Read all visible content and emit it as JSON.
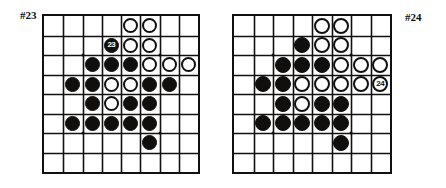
{
  "figure": {
    "kind": "go-problem-diagram",
    "board_size": 8,
    "colors": {
      "line": "#111111",
      "black_stone": "#100f0d",
      "white_stone": "#ffffff",
      "background": "#ffffff"
    }
  },
  "problems": [
    {
      "id": "problem-23",
      "label": "#23",
      "label_position": "top-left",
      "columns": 8,
      "rows": 8,
      "hoshi": [
        {
          "col": 2,
          "row": 2
        },
        {
          "col": 6,
          "row": 2
        },
        {
          "col": 2,
          "row": 6
        },
        {
          "col": 6,
          "row": 6
        }
      ],
      "stones": [
        {
          "col": 5,
          "row": 1,
          "color": "white",
          "number": ""
        },
        {
          "col": 6,
          "row": 1,
          "color": "white",
          "number": ""
        },
        {
          "col": 4,
          "row": 2,
          "color": "black",
          "number": "23"
        },
        {
          "col": 5,
          "row": 2,
          "color": "white",
          "number": ""
        },
        {
          "col": 6,
          "row": 2,
          "color": "white",
          "number": ""
        },
        {
          "col": 3,
          "row": 3,
          "color": "black",
          "number": ""
        },
        {
          "col": 4,
          "row": 3,
          "color": "black",
          "number": ""
        },
        {
          "col": 5,
          "row": 3,
          "color": "black",
          "number": ""
        },
        {
          "col": 6,
          "row": 3,
          "color": "white",
          "number": ""
        },
        {
          "col": 7,
          "row": 3,
          "color": "white",
          "number": ""
        },
        {
          "col": 8,
          "row": 3,
          "color": "white",
          "number": ""
        },
        {
          "col": 2,
          "row": 4,
          "color": "black",
          "number": ""
        },
        {
          "col": 3,
          "row": 4,
          "color": "black",
          "number": ""
        },
        {
          "col": 4,
          "row": 4,
          "color": "white",
          "number": ""
        },
        {
          "col": 5,
          "row": 4,
          "color": "white",
          "number": ""
        },
        {
          "col": 6,
          "row": 4,
          "color": "black",
          "number": ""
        },
        {
          "col": 7,
          "row": 4,
          "color": "black",
          "number": ""
        },
        {
          "col": 3,
          "row": 5,
          "color": "black",
          "number": ""
        },
        {
          "col": 4,
          "row": 5,
          "color": "white",
          "number": ""
        },
        {
          "col": 5,
          "row": 5,
          "color": "black",
          "number": ""
        },
        {
          "col": 6,
          "row": 5,
          "color": "black",
          "number": ""
        },
        {
          "col": 2,
          "row": 6,
          "color": "black",
          "number": ""
        },
        {
          "col": 3,
          "row": 6,
          "color": "black",
          "number": ""
        },
        {
          "col": 4,
          "row": 6,
          "color": "black",
          "number": ""
        },
        {
          "col": 5,
          "row": 6,
          "color": "black",
          "number": ""
        },
        {
          "col": 6,
          "row": 6,
          "color": "black",
          "number": ""
        },
        {
          "col": 6,
          "row": 7,
          "color": "black",
          "number": ""
        }
      ]
    },
    {
      "id": "problem-24",
      "label": "#24",
      "label_position": "top-right",
      "columns": 8,
      "rows": 8,
      "hoshi": [
        {
          "col": 2,
          "row": 2
        },
        {
          "col": 6,
          "row": 2
        },
        {
          "col": 2,
          "row": 6
        },
        {
          "col": 6,
          "row": 6
        }
      ],
      "stones": [
        {
          "col": 5,
          "row": 1,
          "color": "white",
          "number": ""
        },
        {
          "col": 6,
          "row": 1,
          "color": "white",
          "number": ""
        },
        {
          "col": 4,
          "row": 2,
          "color": "black",
          "number": ""
        },
        {
          "col": 5,
          "row": 2,
          "color": "white",
          "number": ""
        },
        {
          "col": 6,
          "row": 2,
          "color": "white",
          "number": ""
        },
        {
          "col": 3,
          "row": 3,
          "color": "black",
          "number": ""
        },
        {
          "col": 4,
          "row": 3,
          "color": "black",
          "number": ""
        },
        {
          "col": 5,
          "row": 3,
          "color": "black",
          "number": ""
        },
        {
          "col": 6,
          "row": 3,
          "color": "white",
          "number": ""
        },
        {
          "col": 7,
          "row": 3,
          "color": "white",
          "number": ""
        },
        {
          "col": 8,
          "row": 3,
          "color": "white",
          "number": ""
        },
        {
          "col": 2,
          "row": 4,
          "color": "black",
          "number": ""
        },
        {
          "col": 3,
          "row": 4,
          "color": "black",
          "number": ""
        },
        {
          "col": 4,
          "row": 4,
          "color": "white",
          "number": ""
        },
        {
          "col": 5,
          "row": 4,
          "color": "white",
          "number": ""
        },
        {
          "col": 6,
          "row": 4,
          "color": "white",
          "number": ""
        },
        {
          "col": 7,
          "row": 4,
          "color": "white",
          "number": ""
        },
        {
          "col": 8,
          "row": 4,
          "color": "white",
          "number": "24"
        },
        {
          "col": 3,
          "row": 5,
          "color": "black",
          "number": ""
        },
        {
          "col": 4,
          "row": 5,
          "color": "white",
          "number": ""
        },
        {
          "col": 5,
          "row": 5,
          "color": "black",
          "number": ""
        },
        {
          "col": 6,
          "row": 5,
          "color": "black",
          "number": ""
        },
        {
          "col": 2,
          "row": 6,
          "color": "black",
          "number": ""
        },
        {
          "col": 3,
          "row": 6,
          "color": "black",
          "number": ""
        },
        {
          "col": 4,
          "row": 6,
          "color": "black",
          "number": ""
        },
        {
          "col": 5,
          "row": 6,
          "color": "black",
          "number": ""
        },
        {
          "col": 6,
          "row": 6,
          "color": "black",
          "number": ""
        },
        {
          "col": 6,
          "row": 7,
          "color": "black",
          "number": ""
        }
      ]
    }
  ]
}
